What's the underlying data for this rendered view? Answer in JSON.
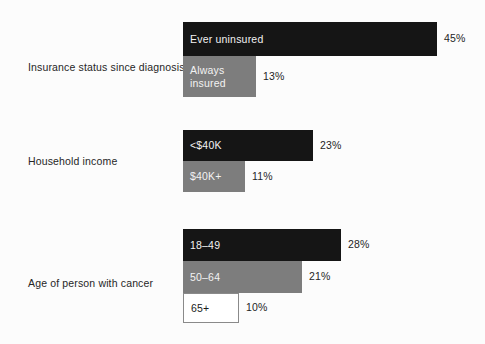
{
  "chart_data": {
    "type": "bar",
    "orientation": "horizontal",
    "title": "",
    "subtitle": "",
    "xlabel": "",
    "ylabel": "",
    "grid": false,
    "legend": "none",
    "value_suffix": "%",
    "xlim": [
      0,
      45
    ],
    "groups": [
      {
        "label": "Insurance status since diagnosis",
        "bars": [
          {
            "label": "Ever uninsured",
            "value": 45,
            "value_label": "45%",
            "style": "black"
          },
          {
            "label": "Always\ninsured",
            "value": 13,
            "value_label": "13%",
            "style": "gray"
          }
        ]
      },
      {
        "label": "Household income",
        "bars": [
          {
            "label": "<$40K",
            "value": 23,
            "value_label": "23%",
            "style": "black"
          },
          {
            "label": "$40K+",
            "value": 11,
            "value_label": "11%",
            "style": "gray"
          }
        ]
      },
      {
        "label": "Age of person with cancer",
        "bars": [
          {
            "label": "18–49",
            "value": 28,
            "value_label": "28%",
            "style": "black"
          },
          {
            "label": "50–64",
            "value": 21,
            "value_label": "21%",
            "style": "gray"
          },
          {
            "label": "65+",
            "value": 10,
            "value_label": "10%",
            "style": "white"
          }
        ]
      }
    ]
  },
  "colors": {
    "background": "#fcfcfc",
    "bar_black": "#151515",
    "bar_gray": "#7d7d7d",
    "bar_white": "#ffffff",
    "bar_white_border": "#8a8a8a",
    "label_text": "#262626",
    "bar_label_light": "#f2f2f2",
    "bar_label_dark": "#1a1a1a"
  }
}
